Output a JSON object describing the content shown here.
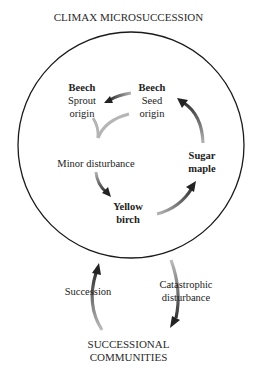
{
  "title": "CLIMAX MICROSUCCESSION",
  "bottom_title": [
    "SUCCESSIONAL",
    "COMMUNITIES"
  ],
  "nodes": {
    "beech_sprout": {
      "name": "Beech",
      "line2": "Sprout",
      "line3": "origin"
    },
    "beech_seed": {
      "name": "Beech",
      "line2": "Seed",
      "line3": "origin"
    },
    "minor_disturbance": "Minor disturbance",
    "sugar_maple": {
      "line1": "Sugar",
      "line2": "maple"
    },
    "yellow_birch": {
      "line1": "Yellow",
      "line2": "birch"
    }
  },
  "outer_labels": {
    "succession": "Succession",
    "catastrophic": {
      "line1": "Catastrophic",
      "line2": "disturbance"
    }
  },
  "colors": {
    "line": "#1a1a1a",
    "arrow_dark": "#222222",
    "arrow_light": "#b0b0b0"
  }
}
